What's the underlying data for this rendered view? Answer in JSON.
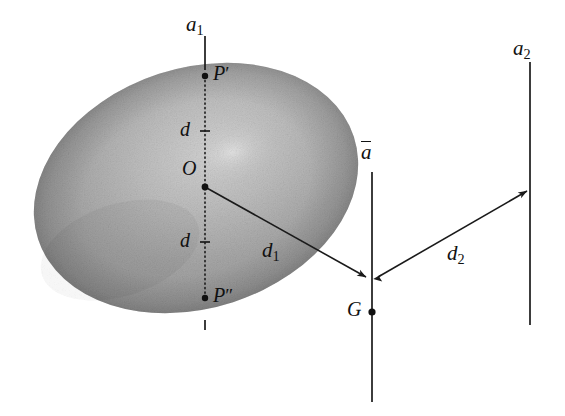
{
  "figure": {
    "type": "geometric-diagram",
    "background_color": "#ffffff",
    "ink_color": "#111111",
    "body_fill": "#a8a8a8"
  },
  "labels": {
    "axis_a1": {
      "base": "a",
      "sub": "1"
    },
    "axis_a2": {
      "base": "a",
      "sub": "2"
    },
    "axis_abar": {
      "base": "a",
      "overbar": true
    },
    "point_p_prime": {
      "base": "P",
      "prime": "′"
    },
    "point_p_double_prime": {
      "base": "P",
      "prime": "″"
    },
    "point_o": "O",
    "point_g": "G",
    "distance_d_upper": "d",
    "distance_d_lower": "d",
    "distance_d1": {
      "base": "d",
      "sub": "1"
    },
    "distance_d2": {
      "base": "d",
      "sub": "2"
    }
  },
  "geometry": {
    "ellipse": {
      "cx": 196,
      "cy": 188,
      "rx": 166,
      "ry": 120,
      "rotation_deg": -18
    },
    "axis_a1": {
      "x": 205,
      "y_top": 36,
      "y_bottom": 330
    },
    "axis_abar": {
      "x": 372,
      "y_top": 172,
      "y_bottom": 402
    },
    "axis_a2": {
      "x": 530,
      "y_top": 62,
      "y_bottom": 325
    },
    "point_o": {
      "x": 205,
      "y": 187
    },
    "point_p_prime": {
      "x": 205,
      "y": 76
    },
    "point_p_double_prime": {
      "x": 205,
      "y": 298
    },
    "point_g": {
      "x": 372,
      "y": 312
    },
    "arrow_d1": {
      "from_x": 205,
      "from_y": 187,
      "to_x": 368,
      "to_y": 278
    },
    "arrow_d2": {
      "from_x": 376,
      "from_y": 278,
      "to_x": 528,
      "to_y": 190
    },
    "tick_d_upper": {
      "x": 205,
      "y": 131
    },
    "tick_d_lower": {
      "x": 205,
      "y": 242
    },
    "tick_bottom": {
      "x": 205,
      "y": 325
    }
  },
  "label_positions": {
    "axis_a1": {
      "x": 186,
      "y": 14
    },
    "axis_a2": {
      "x": 513,
      "y": 38
    },
    "axis_abar": {
      "x": 360,
      "y": 142
    },
    "point_p_prime": {
      "x": 213,
      "y": 63
    },
    "point_p_double_prime": {
      "x": 213,
      "y": 285
    },
    "point_o": {
      "x": 182,
      "y": 158
    },
    "point_g": {
      "x": 348,
      "y": 298
    },
    "distance_d_upper": {
      "x": 180,
      "y": 118
    },
    "distance_d_lower": {
      "x": 180,
      "y": 229
    },
    "distance_d1": {
      "x": 262,
      "y": 236
    },
    "distance_d2": {
      "x": 447,
      "y": 239
    }
  }
}
